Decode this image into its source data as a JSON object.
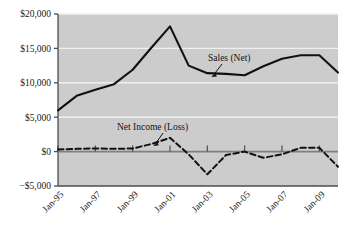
{
  "chart_data": {
    "type": "line",
    "title": "",
    "subtitle": "",
    "xlabel": "",
    "ylabel": "",
    "x": [
      "Jan-95",
      "Jan-96",
      "Jan-97",
      "Jan-98",
      "Jan-99",
      "Jan-00",
      "Jan-01",
      "Jan-02",
      "Jan-03",
      "Jan-04",
      "Jan-05",
      "Jan-06",
      "Jan-07",
      "Jan-08",
      "Jan-09",
      "Jan-10"
    ],
    "xtick_labels": [
      "Jan-95",
      "Jan-97",
      "Jan-99",
      "Jan-01",
      "Jan-03",
      "Jan-05",
      "Jan-07",
      "Jan-09"
    ],
    "ytick_labels": [
      "$20,000",
      "$15,000",
      "$10,000",
      "$5,000",
      "$0",
      "−$5,000"
    ],
    "ytick_values": [
      20000,
      15000,
      10000,
      5000,
      0,
      -5000
    ],
    "ylim": [
      -5000,
      20000
    ],
    "grid": true,
    "grid_axis": "y",
    "legend_position": "inline-annotations",
    "series": [
      {
        "name": "Sales (Net)",
        "style": "solid",
        "color": "#111111",
        "values": [
          6000,
          8100,
          9000,
          9800,
          11900,
          15100,
          18200,
          12500,
          11400,
          11300,
          11100,
          12400,
          13500,
          14000,
          14000,
          11500
        ]
      },
      {
        "name": "Net Income (Loss)",
        "style": "dashed",
        "color": "#111111",
        "values": [
          300,
          400,
          450,
          400,
          450,
          1100,
          2000,
          -400,
          -3300,
          -500,
          0,
          -900,
          -400,
          550,
          550,
          -2200
        ]
      }
    ],
    "annotations": [
      {
        "label": "Sales (Net)",
        "points_to_series": "Sales (Net)"
      },
      {
        "label": "Net Income (Loss)",
        "points_to_series": "Net Income (Loss)"
      }
    ],
    "colors": {
      "plot_background": "#cccccc",
      "gridline": "#f0f0f0",
      "axis": "#4d4d4d",
      "zero_line": "#808080",
      "series_line": "#111111",
      "page_background": "#ffffff",
      "text": "#141414"
    }
  }
}
